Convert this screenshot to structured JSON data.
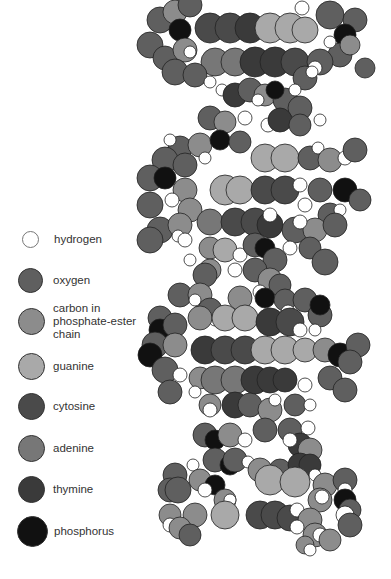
{
  "colors": {
    "hydrogen": "#ffffff",
    "oxygen": "#5f5f5f",
    "carbon": "#8c8c8c",
    "guanine": "#a9a9a9",
    "cytosine": "#4a4a4a",
    "adenine": "#777777",
    "thymine": "#3a3a3a",
    "phosphorus": "#111111"
  },
  "legend": {
    "items": [
      {
        "key": "hydrogen",
        "label": "hydrogen",
        "color": "#ffffff",
        "y": 240,
        "size": 17
      },
      {
        "key": "oxygen",
        "label": "oxygen",
        "color": "#5f5f5f",
        "y": 281,
        "size": 25
      },
      {
        "key": "carbon",
        "label": "carbon in\nphosphate-ester\nchain",
        "color": "#8c8c8c",
        "y": 321,
        "size": 27
      },
      {
        "key": "guanine",
        "label": "guanine",
        "color": "#a9a9a9",
        "y": 367,
        "size": 27
      },
      {
        "key": "cytosine",
        "label": "cytosine",
        "color": "#4a4a4a",
        "y": 407,
        "size": 27
      },
      {
        "key": "adenine",
        "label": "adenine",
        "color": "#777777",
        "y": 449,
        "size": 27
      },
      {
        "key": "thymine",
        "label": "thymine",
        "color": "#3a3a3a",
        "y": 490,
        "size": 27
      },
      {
        "key": "phosphorus",
        "label": "phosphorus",
        "color": "#111111",
        "y": 532,
        "size": 30
      }
    ]
  },
  "molecule": {
    "atoms": [
      [
        "oxygen",
        160,
        20,
        13
      ],
      [
        "carbon",
        175,
        12,
        12
      ],
      [
        "oxygen",
        190,
        5,
        12
      ],
      [
        "phosphorus",
        180,
        30,
        11
      ],
      [
        "oxygen",
        150,
        45,
        13
      ],
      [
        "oxygen",
        165,
        58,
        12
      ],
      [
        "carbon",
        185,
        50,
        12
      ],
      [
        "hydrogen",
        190,
        52,
        6
      ],
      [
        "cytosine",
        210,
        28,
        15
      ],
      [
        "cytosine",
        230,
        28,
        15
      ],
      [
        "thymine",
        250,
        28,
        15
      ],
      [
        "guanine",
        270,
        28,
        15
      ],
      [
        "guanine",
        290,
        28,
        15
      ],
      [
        "guanine",
        305,
        30,
        13
      ],
      [
        "oxygen",
        330,
        15,
        14
      ],
      [
        "hydrogen",
        302,
        8,
        7
      ],
      [
        "oxygen",
        355,
        20,
        12
      ],
      [
        "phosphorus",
        345,
        35,
        11
      ],
      [
        "oxygen",
        340,
        55,
        12
      ],
      [
        "hydrogen",
        330,
        42,
        6
      ],
      [
        "carbon",
        350,
        45,
        10
      ],
      [
        "oxygen",
        365,
        68,
        10
      ],
      [
        "adenine",
        215,
        62,
        14
      ],
      [
        "adenine",
        235,
        62,
        14
      ],
      [
        "thymine",
        255,
        62,
        15
      ],
      [
        "thymine",
        275,
        62,
        15
      ],
      [
        "cytosine",
        295,
        62,
        14
      ],
      [
        "oxygen",
        320,
        62,
        13
      ],
      [
        "hydrogen",
        315,
        68,
        7
      ],
      [
        "oxygen",
        175,
        72,
        13
      ],
      [
        "oxygen",
        195,
        75,
        12
      ],
      [
        "hydrogen",
        210,
        82,
        6
      ],
      [
        "hydrogen",
        222,
        90,
        6
      ],
      [
        "oxygen",
        305,
        78,
        12
      ],
      [
        "hydrogen",
        312,
        72,
        6
      ],
      [
        "thymine",
        235,
        95,
        12
      ],
      [
        "oxygen",
        250,
        90,
        12
      ],
      [
        "carbon",
        265,
        95,
        11
      ],
      [
        "hydrogen",
        258,
        100,
        6
      ],
      [
        "oxygen",
        285,
        100,
        12
      ],
      [
        "oxygen",
        300,
        108,
        12
      ],
      [
        "hydrogen",
        295,
        90,
        6
      ],
      [
        "phosphorus",
        275,
        90,
        9
      ],
      [
        "oxygen",
        210,
        118,
        12
      ],
      [
        "carbon",
        225,
        122,
        11
      ],
      [
        "hydrogen",
        245,
        118,
        7
      ],
      [
        "hydrogen",
        268,
        125,
        7
      ],
      [
        "thymine",
        280,
        120,
        12
      ],
      [
        "oxygen",
        300,
        125,
        11
      ],
      [
        "hydrogen",
        320,
        120,
        6
      ],
      [
        "oxygen",
        180,
        148,
        12
      ],
      [
        "hydrogen",
        170,
        140,
        6
      ],
      [
        "carbon",
        200,
        145,
        12
      ],
      [
        "phosphorus",
        220,
        140,
        10
      ],
      [
        "oxygen",
        240,
        142,
        11
      ],
      [
        "oxygen",
        165,
        160,
        13
      ],
      [
        "oxygen",
        185,
        165,
        12
      ],
      [
        "hydrogen",
        205,
        158,
        6
      ],
      [
        "guanine",
        265,
        158,
        14
      ],
      [
        "guanine",
        285,
        158,
        14
      ],
      [
        "oxygen",
        310,
        158,
        12
      ],
      [
        "hydrogen",
        318,
        148,
        6
      ],
      [
        "carbon",
        330,
        160,
        12
      ],
      [
        "hydrogen",
        345,
        158,
        7
      ],
      [
        "oxygen",
        355,
        150,
        12
      ],
      [
        "oxygen",
        150,
        178,
        13
      ],
      [
        "phosphorus",
        165,
        178,
        11
      ],
      [
        "carbon",
        185,
        190,
        12
      ],
      [
        "guanine",
        225,
        190,
        15
      ],
      [
        "guanine",
        240,
        190,
        14
      ],
      [
        "cytosine",
        265,
        190,
        14
      ],
      [
        "cytosine",
        285,
        190,
        14
      ],
      [
        "hydrogen",
        300,
        185,
        7
      ],
      [
        "oxygen",
        320,
        190,
        12
      ],
      [
        "phosphorus",
        345,
        190,
        12
      ],
      [
        "oxygen",
        360,
        200,
        11
      ],
      [
        "oxygen",
        150,
        205,
        13
      ],
      [
        "hydrogen",
        172,
        200,
        7
      ],
      [
        "carbon",
        190,
        210,
        12
      ],
      [
        "hydrogen",
        305,
        205,
        7
      ],
      [
        "oxygen",
        330,
        215,
        12
      ],
      [
        "hydrogen",
        340,
        210,
        6
      ],
      [
        "oxygen",
        160,
        230,
        13
      ],
      [
        "carbon",
        180,
        225,
        12
      ],
      [
        "hydrogen",
        178,
        236,
        6
      ],
      [
        "adenine",
        210,
        222,
        13
      ],
      [
        "cytosine",
        235,
        222,
        14
      ],
      [
        "cytosine",
        255,
        222,
        14
      ],
      [
        "thymine",
        270,
        225,
        13
      ],
      [
        "hydrogen",
        270,
        215,
        7
      ],
      [
        "oxygen",
        295,
        230,
        13
      ],
      [
        "carbon",
        315,
        230,
        12
      ],
      [
        "oxygen",
        335,
        225,
        12
      ],
      [
        "hydrogen",
        300,
        222,
        7
      ],
      [
        "oxygen",
        150,
        240,
        13
      ],
      [
        "hydrogen",
        185,
        240,
        7
      ],
      [
        "carbon",
        210,
        248,
        11
      ],
      [
        "guanine",
        225,
        250,
        12
      ],
      [
        "hydrogen",
        240,
        255,
        7
      ],
      [
        "oxygen",
        255,
        245,
        12
      ],
      [
        "phosphorus",
        265,
        248,
        10
      ],
      [
        "oxygen",
        275,
        260,
        12
      ],
      [
        "hydrogen",
        290,
        248,
        7
      ],
      [
        "oxygen",
        310,
        248,
        11
      ],
      [
        "oxygen",
        325,
        262,
        13
      ],
      [
        "hydrogen",
        190,
        260,
        6
      ],
      [
        "carbon",
        210,
        270,
        11
      ],
      [
        "oxygen",
        205,
        275,
        12
      ],
      [
        "hydrogen",
        235,
        270,
        7
      ],
      [
        "oxygen",
        255,
        270,
        12
      ],
      [
        "carbon",
        270,
        280,
        12
      ],
      [
        "hydrogen",
        260,
        292,
        7
      ],
      [
        "oxygen",
        280,
        285,
        11
      ],
      [
        "oxygen",
        180,
        295,
        12
      ],
      [
        "carbon",
        200,
        295,
        12
      ],
      [
        "hydrogen",
        195,
        300,
        6
      ],
      [
        "oxygen",
        210,
        310,
        12
      ],
      [
        "hydrogen",
        215,
        320,
        6
      ],
      [
        "carbon",
        240,
        298,
        12
      ],
      [
        "phosphorus",
        265,
        298,
        10
      ],
      [
        "oxygen",
        285,
        300,
        11
      ],
      [
        "hydrogen",
        288,
        312,
        7
      ],
      [
        "oxygen",
        305,
        300,
        12
      ],
      [
        "oxygen",
        160,
        318,
        12
      ],
      [
        "phosphorus",
        160,
        330,
        11
      ],
      [
        "oxygen",
        175,
        325,
        12
      ],
      [
        "carbon",
        200,
        318,
        12
      ],
      [
        "guanine",
        225,
        318,
        13
      ],
      [
        "guanine",
        245,
        318,
        13
      ],
      [
        "thymine",
        270,
        322,
        14
      ],
      [
        "cytosine",
        290,
        322,
        14
      ],
      [
        "hydrogen",
        300,
        330,
        7
      ],
      [
        "oxygen",
        320,
        315,
        12
      ],
      [
        "phosphorus",
        320,
        305,
        10
      ],
      [
        "hydrogen",
        315,
        330,
        6
      ],
      [
        "oxygen",
        155,
        345,
        13
      ],
      [
        "phosphorus",
        150,
        355,
        12
      ],
      [
        "carbon",
        175,
        345,
        12
      ],
      [
        "thymine",
        205,
        350,
        14
      ],
      [
        "cytosine",
        225,
        350,
        14
      ],
      [
        "cytosine",
        245,
        350,
        14
      ],
      [
        "guanine",
        265,
        350,
        14
      ],
      [
        "guanine",
        285,
        350,
        14
      ],
      [
        "guanine",
        305,
        350,
        12
      ],
      [
        "carbon",
        325,
        350,
        12
      ],
      [
        "phosphorus",
        340,
        355,
        12
      ],
      [
        "oxygen",
        358,
        345,
        12
      ],
      [
        "oxygen",
        350,
        362,
        12
      ],
      [
        "oxygen",
        165,
        370,
        13
      ],
      [
        "hydrogen",
        180,
        375,
        7
      ],
      [
        "carbon",
        200,
        378,
        11
      ],
      [
        "adenine",
        215,
        380,
        14
      ],
      [
        "adenine",
        235,
        380,
        14
      ],
      [
        "thymine",
        255,
        380,
        14
      ],
      [
        "thymine",
        270,
        380,
        13
      ],
      [
        "thymine",
        285,
        380,
        12
      ],
      [
        "hydrogen",
        305,
        385,
        7
      ],
      [
        "oxygen",
        330,
        378,
        12
      ],
      [
        "oxygen",
        345,
        390,
        12
      ],
      [
        "oxygen",
        170,
        392,
        12
      ],
      [
        "hydrogen",
        195,
        392,
        6
      ],
      [
        "carbon",
        210,
        405,
        11
      ],
      [
        "hydrogen",
        210,
        410,
        7
      ],
      [
        "thymine",
        235,
        405,
        13
      ],
      [
        "oxygen",
        250,
        405,
        12
      ],
      [
        "carbon",
        270,
        410,
        12
      ],
      [
        "hydrogen",
        275,
        400,
        6
      ],
      [
        "oxygen",
        295,
        405,
        11
      ],
      [
        "hydrogen",
        310,
        405,
        6
      ],
      [
        "oxygen",
        205,
        435,
        12
      ],
      [
        "phosphorus",
        215,
        440,
        10
      ],
      [
        "carbon",
        230,
        435,
        12
      ],
      [
        "hydrogen",
        245,
        440,
        7
      ],
      [
        "oxygen",
        265,
        430,
        12
      ],
      [
        "oxygen",
        290,
        430,
        12
      ],
      [
        "hydrogen",
        308,
        428,
        7
      ],
      [
        "thymine",
        300,
        445,
        12
      ],
      [
        "carbon",
        310,
        450,
        12
      ],
      [
        "hydrogen",
        290,
        440,
        7
      ],
      [
        "oxygen",
        215,
        460,
        12
      ],
      [
        "phosphorus",
        230,
        465,
        10
      ],
      [
        "oxygen",
        235,
        460,
        12
      ],
      [
        "hydrogen",
        248,
        462,
        6
      ],
      [
        "carbon",
        260,
        470,
        12
      ],
      [
        "oxygen",
        280,
        470,
        11
      ],
      [
        "thymine",
        300,
        465,
        12
      ],
      [
        "thymine",
        310,
        465,
        11
      ],
      [
        "oxygen",
        175,
        475,
        12
      ],
      [
        "hydrogen",
        193,
        465,
        6
      ],
      [
        "carbon",
        200,
        480,
        11
      ],
      [
        "phosphorus",
        215,
        485,
        10
      ],
      [
        "guanine",
        270,
        480,
        15
      ],
      [
        "guanine",
        295,
        482,
        15
      ],
      [
        "hydrogen",
        315,
        475,
        6
      ],
      [
        "carbon",
        325,
        485,
        12
      ],
      [
        "oxygen",
        345,
        480,
        12
      ],
      [
        "hydrogen",
        345,
        490,
        7
      ],
      [
        "oxygen",
        170,
        490,
        12
      ],
      [
        "oxygen",
        178,
        490,
        13
      ],
      [
        "hydrogen",
        205,
        490,
        7
      ],
      [
        "carbon",
        225,
        500,
        11
      ],
      [
        "hydrogen",
        230,
        500,
        6
      ],
      [
        "carbon",
        320,
        500,
        12
      ],
      [
        "hydrogen",
        322,
        497,
        7
      ],
      [
        "phosphorus",
        345,
        500,
        11
      ],
      [
        "oxygen",
        350,
        510,
        11
      ],
      [
        "carbon",
        170,
        515,
        11
      ],
      [
        "carbon",
        195,
        515,
        12
      ],
      [
        "guanine",
        225,
        515,
        14
      ],
      [
        "cytosine",
        260,
        515,
        14
      ],
      [
        "cytosine",
        275,
        515,
        14
      ],
      [
        "cytosine",
        290,
        518,
        13
      ],
      [
        "hydrogen",
        297,
        510,
        7
      ],
      [
        "carbon",
        310,
        520,
        12
      ],
      [
        "hydrogen",
        345,
        515,
        9
      ],
      [
        "oxygen",
        350,
        525,
        12
      ],
      [
        "hydrogen",
        170,
        525,
        7
      ],
      [
        "carbon",
        180,
        528,
        11
      ],
      [
        "oxygen",
        190,
        535,
        11
      ],
      [
        "hydrogen",
        297,
        527,
        7
      ],
      [
        "carbon",
        315,
        535,
        12
      ],
      [
        "hydrogen",
        320,
        535,
        7
      ],
      [
        "carbon",
        305,
        545,
        9
      ],
      [
        "hydrogen",
        310,
        550,
        6
      ],
      [
        "carbon",
        330,
        540,
        11
      ]
    ]
  }
}
